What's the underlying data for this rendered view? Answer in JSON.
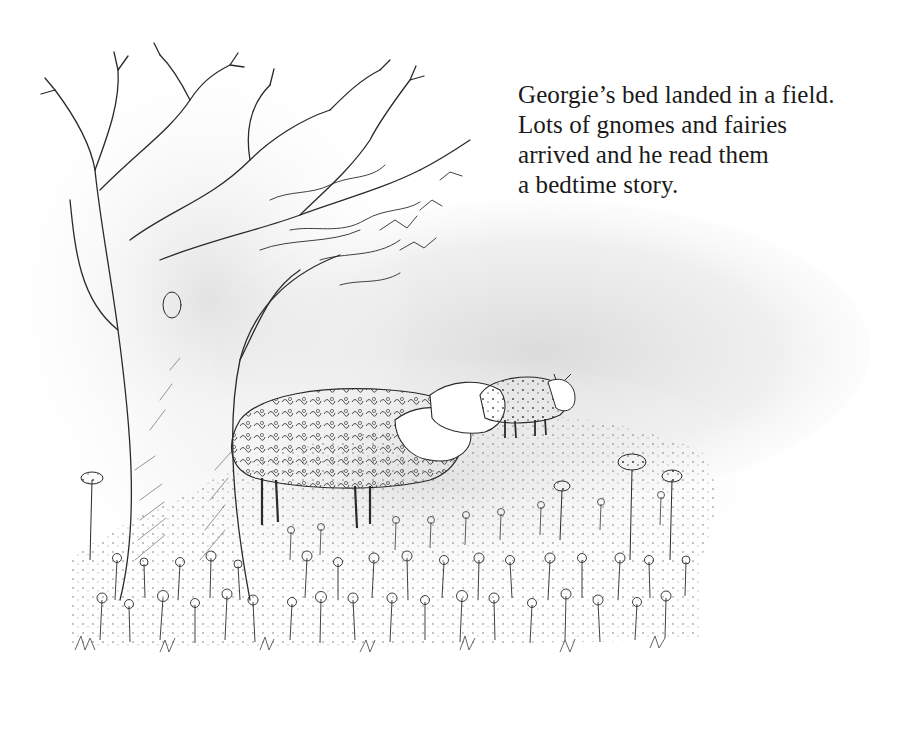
{
  "page": {
    "caption_lines": [
      "Georgie’s bed landed in a field.",
      "Lots of gnomes and fairies",
      "arrived and he read them",
      "a bedtime story."
    ]
  },
  "illustration": {
    "subjects": [
      "bare-tree",
      "sheep",
      "sheep",
      "sheep",
      "flower-meadow"
    ],
    "style": "pencil-sketch",
    "ink_color": "#2a2a2a",
    "wash_color": "#d9d9d9"
  }
}
